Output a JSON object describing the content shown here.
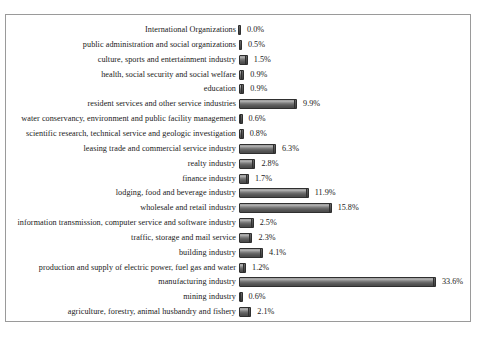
{
  "chart_data": {
    "type": "bar",
    "orientation": "horizontal",
    "title": "",
    "subtitle": "",
    "xlabel": "",
    "ylabel": "",
    "grid": false,
    "legend": null,
    "legend_position": "none",
    "xlim": [
      0,
      33.6
    ],
    "value_suffix": "%",
    "bar_color": "#4a4a4a",
    "border_color": "#9a9a9a",
    "text_color": "#1a1a1a",
    "categories": [
      "International Organizations",
      "public administration and social organizations",
      "culture, sports and entertainment industry",
      "health, social security and social welfare",
      "education",
      "resident services and other service industries",
      "water conservancy, environment and public facility management",
      "scientific research, technical service and geologic investigation",
      "leasing trade and commercial service industry",
      "realty industry",
      "finance industry",
      "lodging, food and beverage industry",
      "wholesale and retail industry",
      "information transmission, computer service and software industry",
      "traffic, storage and mail service",
      "building industry",
      "production and  supply of electric power, fuel gas and water",
      "manufacturing industry",
      "mining industry",
      "agriculture, forestry, animal husbandry and fishery"
    ],
    "values": [
      0.0,
      0.5,
      1.5,
      0.9,
      0.9,
      9.9,
      0.6,
      0.8,
      6.3,
      2.8,
      1.7,
      11.9,
      15.8,
      2.5,
      2.3,
      4.1,
      1.2,
      33.6,
      0.6,
      2.1
    ],
    "value_labels": [
      "0.0%",
      "0.5%",
      "1.5%",
      "0.9%",
      "0.9%",
      "9.9%",
      "0.6%",
      "0.8%",
      "6.3%",
      "2.8%",
      "1.7%",
      "11.9%",
      "15.8%",
      "2.5%",
      "2.3%",
      "4.1%",
      "1.2%",
      "33.6%",
      "0.6%",
      "2.1%"
    ]
  }
}
